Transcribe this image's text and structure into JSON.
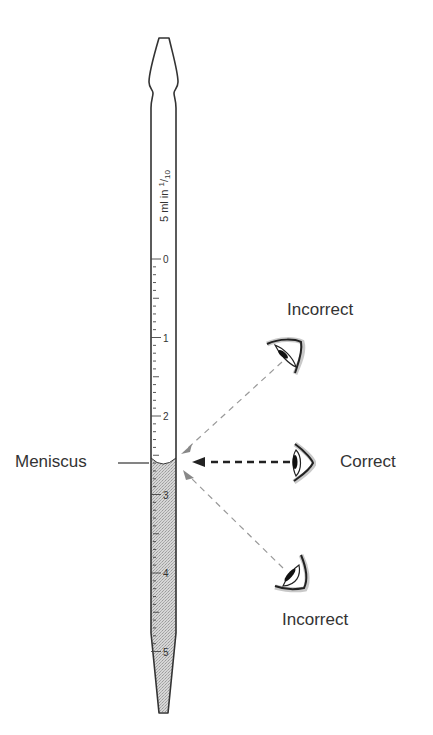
{
  "diagram": {
    "pipette": {
      "label": "5 ml in 1/10",
      "label_main": "5 ml in ",
      "label_frac_num": "1",
      "label_frac_den": "10",
      "scale_major": [
        "0",
        "1",
        "2",
        "3",
        "4",
        "5"
      ],
      "fill_color": "#c8c8c8",
      "outline_color": "#333333"
    },
    "labels": {
      "meniscus": "Meniscus",
      "incorrect_top": "Incorrect",
      "correct": "Correct",
      "incorrect_bottom": "Incorrect"
    },
    "sightlines": [
      {
        "from": "eye-above",
        "style": "light-dashed",
        "result": "Incorrect"
      },
      {
        "from": "eye-level",
        "style": "bold-dashed",
        "result": "Correct"
      },
      {
        "from": "eye-below",
        "style": "light-dashed",
        "result": "Incorrect"
      }
    ]
  }
}
